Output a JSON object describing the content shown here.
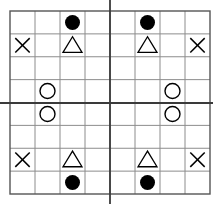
{
  "figure": {
    "background_color": "#ffffff"
  },
  "grid": {
    "columns": 8,
    "rows": 8,
    "left": 10,
    "top": 11,
    "cell_width": 25,
    "cell_height": 22.875,
    "line_color": "#8c8c8c",
    "line_width": 1,
    "border_color": "#555555",
    "border_width": 1.4
  },
  "axes": {
    "vertical": {
      "label": "vertical-axis-line",
      "x": 110,
      "y1": 0,
      "y2": 204,
      "color": "#3a3a3a",
      "width": 1.8
    },
    "horizontal": {
      "label": "horizontal-axis-line",
      "y": 103,
      "x1": 0,
      "x2": 213,
      "color": "#3a3a3a",
      "width": 1.8
    }
  },
  "symbols": {
    "colors": {
      "filled": "#000000",
      "stroke": "#000000"
    },
    "legend": [
      {
        "name": "filled-circle",
        "glyph": "●",
        "count": 4
      },
      {
        "name": "triangle",
        "glyph": "△",
        "count": 4
      },
      {
        "name": "open-circle",
        "glyph": "○",
        "count": 4
      },
      {
        "name": "x-mark",
        "glyph": "✕",
        "count": 4
      }
    ],
    "items": [
      {
        "type": "filled-circle",
        "col": 3,
        "row": 1
      },
      {
        "type": "filled-circle",
        "col": 6,
        "row": 1
      },
      {
        "type": "x-mark",
        "col": 1,
        "row": 2
      },
      {
        "type": "triangle",
        "col": 3,
        "row": 2
      },
      {
        "type": "triangle",
        "col": 6,
        "row": 2
      },
      {
        "type": "x-mark",
        "col": 8,
        "row": 2
      },
      {
        "type": "open-circle",
        "col": 2,
        "row": 4
      },
      {
        "type": "open-circle",
        "col": 7,
        "row": 4
      },
      {
        "type": "open-circle",
        "col": 2,
        "row": 5
      },
      {
        "type": "open-circle",
        "col": 7,
        "row": 5
      },
      {
        "type": "x-mark",
        "col": 1,
        "row": 7
      },
      {
        "type": "triangle",
        "col": 3,
        "row": 7
      },
      {
        "type": "triangle",
        "col": 6,
        "row": 7
      },
      {
        "type": "x-mark",
        "col": 8,
        "row": 7
      },
      {
        "type": "filled-circle",
        "col": 3,
        "row": 8
      },
      {
        "type": "filled-circle",
        "col": 6,
        "row": 8
      }
    ]
  }
}
